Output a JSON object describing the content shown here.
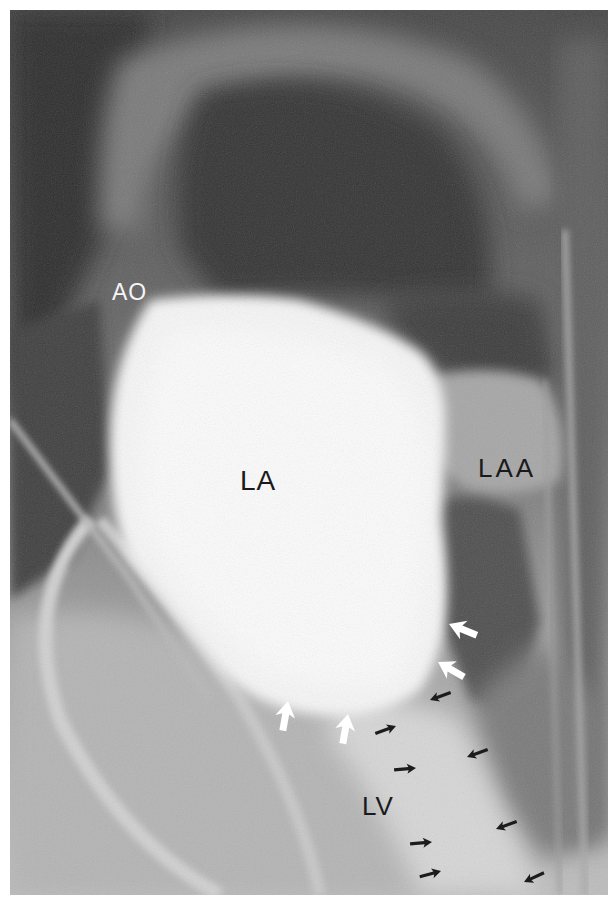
{
  "figure": {
    "colors": {
      "background": "#ffffff",
      "dark_region": "#3a3a3a",
      "mid_gray": "#8a8a8a",
      "contrast_fill": "#f4f4f4",
      "label_dark": "#1a1a1a",
      "label_light": "#f5f5f5"
    }
  },
  "labels": {
    "ao": "AO",
    "la": "LA",
    "laa": "LAA",
    "lv": "LV"
  },
  "annotations": {
    "white_arrows": [
      {
        "x": 470,
        "y": 631,
        "direction": "upper-left"
      },
      {
        "x": 456,
        "y": 673,
        "direction": "upper-left"
      },
      {
        "x": 280,
        "y": 722,
        "direction": "up"
      },
      {
        "x": 340,
        "y": 735,
        "direction": "up"
      }
    ],
    "black_arrows": [
      {
        "x": 438,
        "y": 697,
        "direction": "left"
      },
      {
        "x": 383,
        "y": 730,
        "direction": "right"
      },
      {
        "x": 403,
        "y": 767,
        "direction": "right"
      },
      {
        "x": 477,
        "y": 752,
        "direction": "left"
      },
      {
        "x": 420,
        "y": 843,
        "direction": "right"
      },
      {
        "x": 428,
        "y": 873,
        "direction": "right"
      },
      {
        "x": 506,
        "y": 826,
        "direction": "left"
      },
      {
        "x": 533,
        "y": 878,
        "direction": "left"
      }
    ]
  }
}
